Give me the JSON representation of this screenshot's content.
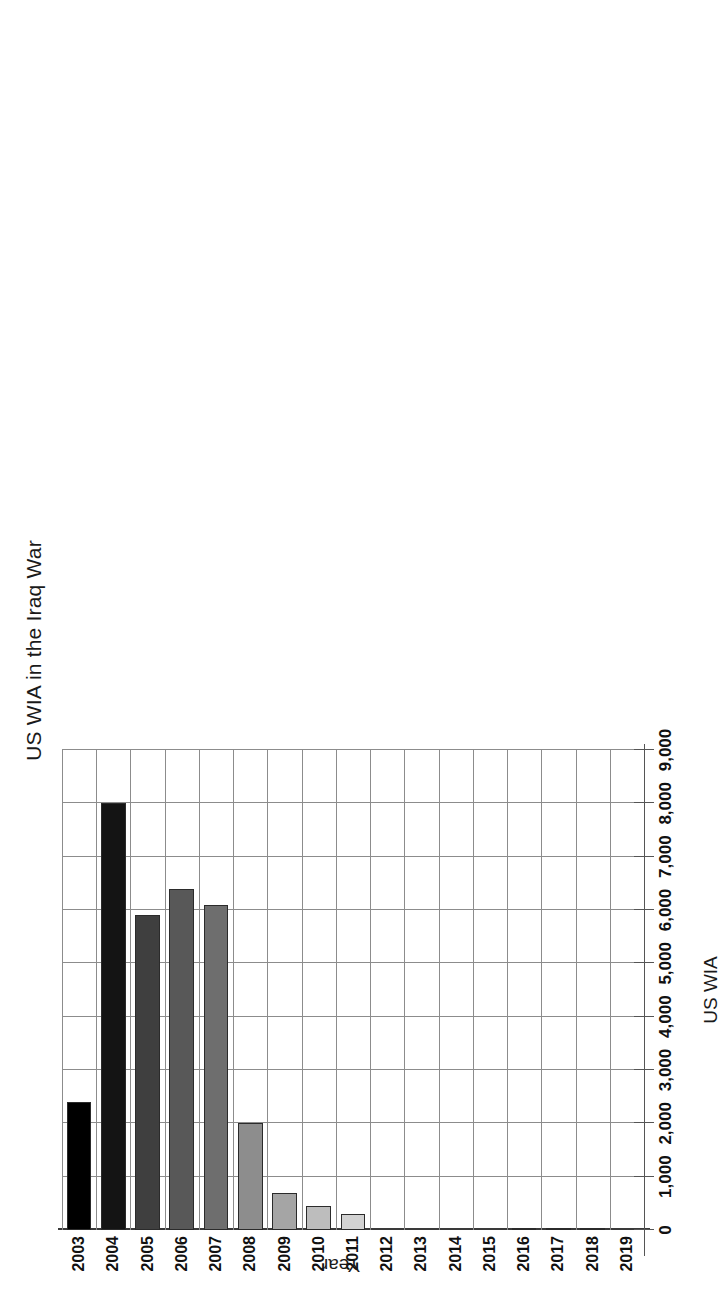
{
  "chart_data": {
    "type": "bar",
    "orientation": "horizontal",
    "title": "US WIA in the Iraq War",
    "xlabel": "US WIA",
    "ylabel": "Year",
    "categories": [
      "2003",
      "2004",
      "2005",
      "2006",
      "2007",
      "2008",
      "2009",
      "2010",
      "2011",
      "2012",
      "2013",
      "2014",
      "2015",
      "2016",
      "2017",
      "2018",
      "2019"
    ],
    "values": [
      2400,
      8000,
      5900,
      6400,
      6100,
      2000,
      700,
      450,
      300,
      0,
      0,
      0,
      0,
      25,
      30,
      35,
      0
    ],
    "series": [
      {
        "name": "US WIA",
        "values": [
          2400,
          8000,
          5900,
          6400,
          6100,
          2000,
          700,
          450,
          300,
          0,
          0,
          0,
          0,
          25,
          30,
          35,
          0
        ]
      }
    ],
    "bar_colors": [
      "#000000",
      "#141414",
      "#3f3f3f",
      "#585858",
      "#6e6e6e",
      "#8d8d8d",
      "#a5a5a5",
      "#bdbdbd",
      "#d2d2d2",
      "#e8e8e8",
      "#e8e8e8",
      "#e8e8e8",
      "#e8e8e8",
      "#f2f2f2",
      "#f2f2f2",
      "#f2f2f2",
      "#f2f2f2"
    ],
    "tick_values": [
      0,
      1000,
      2000,
      3000,
      4000,
      5000,
      6000,
      7000,
      8000,
      9000
    ],
    "tick_labels": [
      "0",
      "1,000",
      "2,000",
      "3,000",
      "4,000",
      "5,000",
      "6,000",
      "7,000",
      "8,000",
      "9,000"
    ],
    "xlim": [
      0,
      9000
    ],
    "grid": true,
    "legend": "none",
    "gridline_color": "#8c8c8c",
    "bar_outline_color": "#2b2b2b"
  }
}
